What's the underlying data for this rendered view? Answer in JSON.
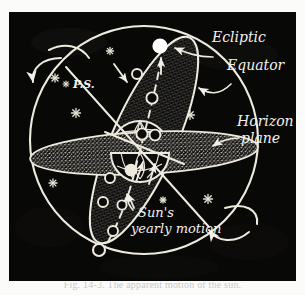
{
  "figure": {
    "domain": "Diagram",
    "caption": "Fig. 14-3. The apparent motion of the sun."
  },
  "panel": {
    "background_color": "#080807",
    "ink_color": "#f2f0ea",
    "stipple_color": "#cfcbc0"
  },
  "labels": {
    "ecliptic": "Ecliptic",
    "equator": "Equator",
    "horizon_plane_line1": "Horizon",
    "horizon_plane_line2": "plane",
    "suns_motion_line1": "Sun's",
    "suns_motion_line2": "yearly motion",
    "pole_star": "P.S."
  },
  "elements": {
    "celestial_sphere": "celestial-sphere-outline",
    "equator_band": "equator-band-ellipse",
    "horizon_band": "horizon-plane-ellipse",
    "earth": "earth-globe",
    "sun": "sun-disc",
    "polar_axis": "polar-axis",
    "rotation_arrow_top": "rotation-arrow-north",
    "rotation_arrow_bottom": "rotation-arrow-south",
    "ecliptic_path": "sun-position-dashed-path"
  },
  "sun_positions": [
    {
      "id": 1,
      "cx": 160,
      "cy": 46,
      "r": 7.5,
      "filled": true
    },
    {
      "id": 2,
      "cx": 135,
      "cy": 62,
      "r": 5.0,
      "filled": false
    },
    {
      "id": 3,
      "cx": 150,
      "cy": 85,
      "r": 5.5,
      "filled": false
    },
    {
      "id": 4,
      "cx": 138,
      "cy": 122,
      "r": 5.5,
      "filled": false
    },
    {
      "id": 5,
      "cx": 128,
      "cy": 158,
      "r": 5.5,
      "filled": true
    },
    {
      "id": 6,
      "cx": 106,
      "cy": 168,
      "r": 5.0,
      "filled": false
    },
    {
      "id": 7,
      "cx": 99,
      "cy": 192,
      "r": 5.0,
      "filled": false
    },
    {
      "id": 8,
      "cx": 118,
      "cy": 196,
      "r": 4.5,
      "filled": false
    },
    {
      "id": 9,
      "cx": 109,
      "cy": 222,
      "r": 5.0,
      "filled": false
    },
    {
      "id": 10,
      "cx": 95,
      "cy": 240,
      "r": 6.0,
      "filled": false
    }
  ],
  "stars": [
    {
      "id": 1,
      "x": 55,
      "y": 75,
      "size": 5
    },
    {
      "id": 2,
      "x": 75,
      "y": 110,
      "size": 6
    },
    {
      "id": 3,
      "x": 110,
      "y": 48,
      "size": 5
    },
    {
      "id": 4,
      "x": 53,
      "y": 180,
      "size": 5
    },
    {
      "id": 5,
      "x": 190,
      "y": 112,
      "size": 6
    },
    {
      "id": 6,
      "x": 208,
      "y": 196,
      "size": 6
    },
    {
      "id": 7,
      "x": 163,
      "y": 197,
      "size": 4
    },
    {
      "id": 8,
      "x": 152,
      "y": 64,
      "size": 4
    }
  ]
}
